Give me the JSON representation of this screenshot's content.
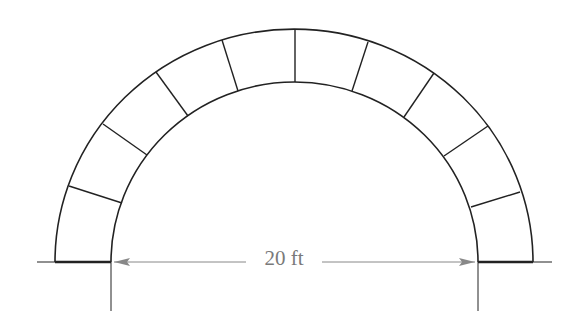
{
  "diagram": {
    "type": "semicircular-arch",
    "voussoir_count": 9,
    "dimension": {
      "label": "20 ft",
      "meaning": "inner span of arch"
    },
    "colors": {
      "stroke": "#222222",
      "dimension": "#888888",
      "background": "#ffffff"
    }
  }
}
